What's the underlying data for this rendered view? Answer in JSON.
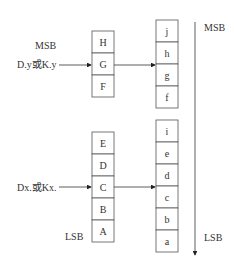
{
  "diagram": {
    "source_top_register": {
      "input_label": "D.y或K.y",
      "msb_label": "MSB",
      "cells": [
        "H",
        "G",
        "F"
      ]
    },
    "source_bottom_register": {
      "input_label": "Dx.或Kx.",
      "lsb_label": "LSB",
      "cells": [
        "E",
        "D",
        "C",
        "B",
        "A"
      ]
    },
    "dest_top_register": {
      "cells": [
        "j",
        "h",
        "g",
        "f"
      ]
    },
    "dest_bottom_register": {
      "cells": [
        "i",
        "e",
        "d",
        "c",
        "b",
        "a"
      ]
    },
    "direction_axis": {
      "top_label": "MSB",
      "bottom_label": "LSB"
    }
  }
}
